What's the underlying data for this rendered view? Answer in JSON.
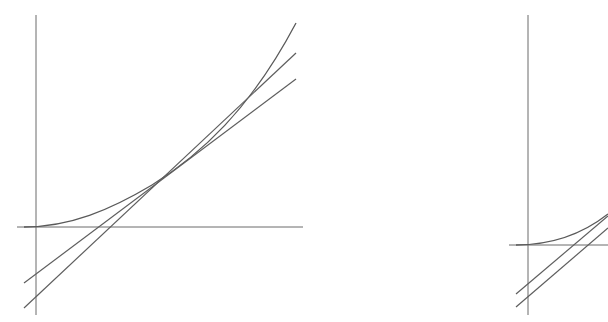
{
  "diagram": {
    "panels": [
      {
        "id": "left",
        "axes": {
          "x_axis_y": 227,
          "x_from": 17,
          "x_to": 303,
          "y_axis_x": 36,
          "y_from": 15,
          "y_to": 315
        },
        "curve": {
          "type": "convex",
          "points": [
            [
              24,
              227
            ],
            [
              60,
              224
            ],
            [
              100,
              212
            ],
            [
              130,
              198
            ],
            [
              152,
              185
            ],
            [
              180,
              164
            ],
            [
              210,
              139
            ],
            [
              240,
              108
            ],
            [
              268,
              71
            ],
            [
              296,
              23
            ]
          ]
        },
        "lines": [
          {
            "name": "line-a",
            "from": [
              24,
              308
            ],
            "to": [
              296,
              53
            ]
          },
          {
            "name": "line-b",
            "from": [
              24,
              283
            ],
            "to": [
              296,
              79
            ]
          }
        ],
        "intersection_point": [
          152,
          185
        ]
      },
      {
        "id": "right",
        "axes": {
          "x_axis_y": 245,
          "x_from": 509,
          "x_to": 608,
          "y_axis_x": 528,
          "y_from": 15,
          "y_to": 315
        },
        "curve": {
          "type": "convex",
          "points": [
            [
              516,
              245
            ],
            [
              540,
              244
            ],
            [
              560,
              240
            ],
            [
              580,
              233
            ],
            [
              598,
              222
            ],
            [
              608,
              214
            ]
          ]
        },
        "lines": [
          {
            "name": "line-a",
            "from": [
              516,
              307
            ],
            "to": [
              608,
              222
            ]
          },
          {
            "name": "line-b",
            "from": [
              516,
              294
            ],
            "to": [
              608,
              219
            ]
          }
        ]
      }
    ],
    "colors": {
      "stroke": "#5e5e5e",
      "axis": "#6b6b6b",
      "background": "#ffffff"
    }
  }
}
